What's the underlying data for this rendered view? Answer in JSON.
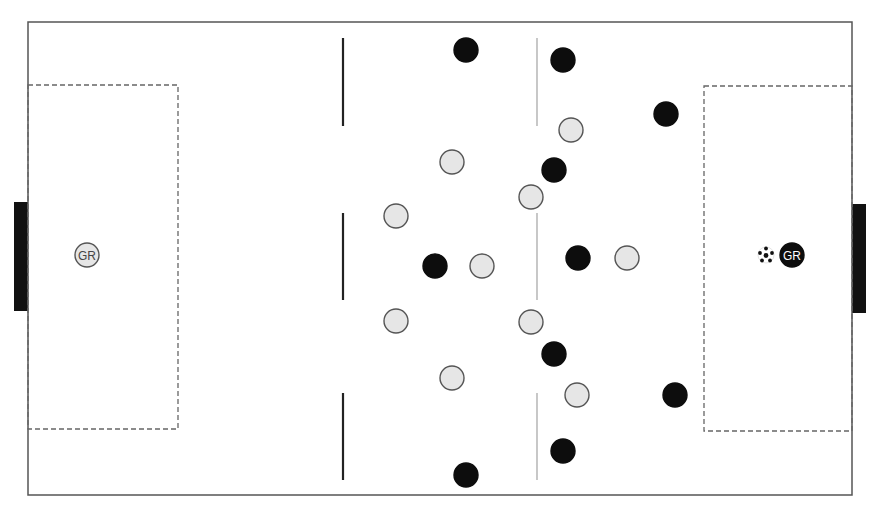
{
  "colors": {
    "background": "#ffffff",
    "pitch_line": "#555555",
    "goal": "#111111",
    "penalty_box": "#666666",
    "solid_line": "#222222",
    "grey_line": "#9a9a9a",
    "team_light_fill": "#e6e6e6",
    "team_light_stroke": "#555555",
    "team_dark_fill": "#0d0d0d",
    "team_dark_stroke": "#0d0d0d"
  },
  "pitch": {
    "x": 28,
    "y": 22,
    "width": 824,
    "height": 473
  },
  "goals": {
    "left": {
      "x": 14,
      "y": 202,
      "width": 14,
      "height": 109
    },
    "right": {
      "x": 852,
      "y": 204,
      "width": 14,
      "height": 109
    }
  },
  "penalty_boxes": {
    "left": {
      "x": 28,
      "y": 85,
      "width": 150,
      "height": 344
    },
    "right": {
      "x": 704,
      "y": 86,
      "width": 148,
      "height": 345
    }
  },
  "zone_lines": {
    "solid": {
      "x": 343,
      "segments": [
        [
          38,
          126
        ],
        [
          213,
          300
        ],
        [
          393,
          480
        ]
      ]
    },
    "grey": {
      "x": 537,
      "segments": [
        [
          38,
          126
        ],
        [
          213,
          300
        ],
        [
          393,
          480
        ]
      ]
    }
  },
  "player_radius": 12,
  "teams": {
    "light": {
      "name": "light-team",
      "players": [
        {
          "x": 87,
          "y": 255,
          "label": "GR"
        },
        {
          "x": 452,
          "y": 162,
          "label": ""
        },
        {
          "x": 396,
          "y": 216,
          "label": ""
        },
        {
          "x": 482,
          "y": 266,
          "label": ""
        },
        {
          "x": 396,
          "y": 321,
          "label": ""
        },
        {
          "x": 452,
          "y": 378,
          "label": ""
        },
        {
          "x": 571,
          "y": 130,
          "label": ""
        },
        {
          "x": 531,
          "y": 197,
          "label": ""
        },
        {
          "x": 531,
          "y": 322,
          "label": ""
        },
        {
          "x": 577,
          "y": 395,
          "label": ""
        },
        {
          "x": 627,
          "y": 258,
          "label": ""
        }
      ]
    },
    "dark": {
      "name": "dark-team",
      "players": [
        {
          "x": 466,
          "y": 50,
          "label": ""
        },
        {
          "x": 563,
          "y": 60,
          "label": ""
        },
        {
          "x": 666,
          "y": 114,
          "label": ""
        },
        {
          "x": 554,
          "y": 170,
          "label": ""
        },
        {
          "x": 435,
          "y": 266,
          "label": ""
        },
        {
          "x": 578,
          "y": 258,
          "label": ""
        },
        {
          "x": 554,
          "y": 354,
          "label": ""
        },
        {
          "x": 675,
          "y": 395,
          "label": ""
        },
        {
          "x": 563,
          "y": 451,
          "label": ""
        },
        {
          "x": 466,
          "y": 475,
          "label": ""
        },
        {
          "x": 792,
          "y": 255,
          "label": "GR"
        }
      ]
    }
  },
  "ball": {
    "x": 766,
    "y": 255,
    "r": 8,
    "icon": "soccer-ball-icon"
  },
  "labels": {
    "goalkeeper": "GR"
  }
}
